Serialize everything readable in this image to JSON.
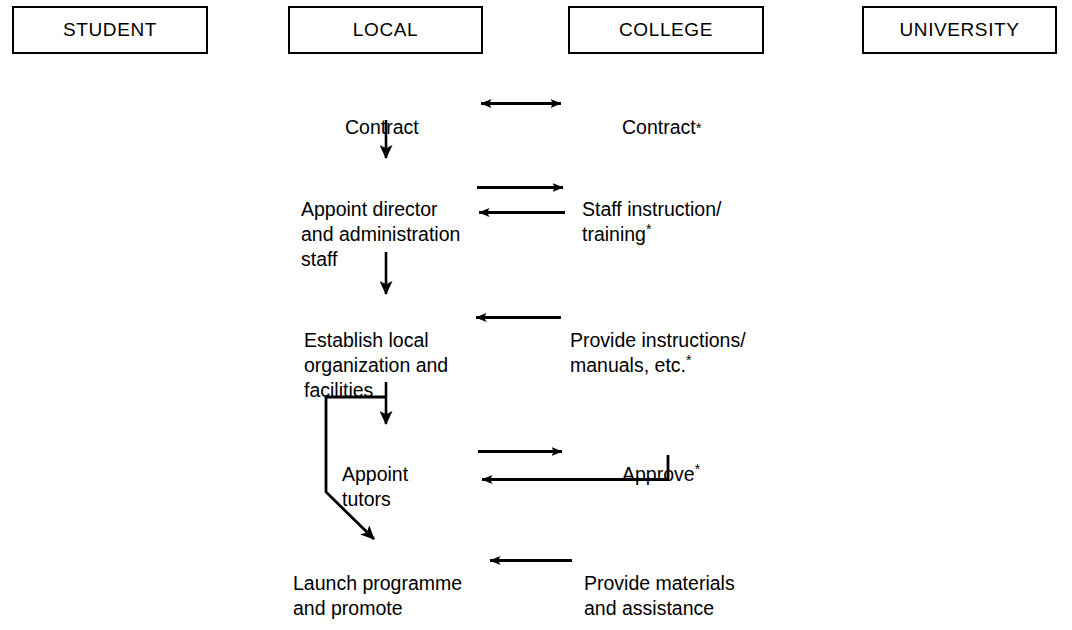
{
  "diagram": {
    "columns": [
      {
        "id": "student",
        "label": "STUDENT"
      },
      {
        "id": "local",
        "label": "LOCAL"
      },
      {
        "id": "college",
        "label": "COLLEGE"
      },
      {
        "id": "university",
        "label": "UNIVERSITY"
      }
    ],
    "nodes": {
      "local_contract": {
        "text": "Contract"
      },
      "college_contract": {
        "text": "Contract",
        "footnote": "*"
      },
      "local_appoint": {
        "text": "Appoint director\nand administration\nstaff"
      },
      "college_staff": {
        "text": "Staff instruction/\ntraining",
        "footnote": "*"
      },
      "local_establish": {
        "text": "Establish local\norganization and\nfacilities"
      },
      "college_provide": {
        "text": "Provide instructions/\nmanuals, etc.",
        "footnote": "*"
      },
      "local_tutors": {
        "text": "Appoint\ntutors"
      },
      "college_approve": {
        "text": "Approve",
        "footnote": "*"
      },
      "local_launch": {
        "text": "Launch programme\nand promote"
      },
      "college_materials": {
        "text": "Provide materials\nand assistance"
      }
    },
    "connectors": [
      {
        "id": "contract-bidirectional",
        "kind": "double-arrow-horizontal",
        "from": "local_contract",
        "to": "college_contract"
      },
      {
        "id": "contract-to-appoint",
        "kind": "arrow-down",
        "from": "local_contract",
        "to": "local_appoint"
      },
      {
        "id": "appoint-to-staff",
        "kind": "arrow-right",
        "from": "local_appoint",
        "to": "college_staff"
      },
      {
        "id": "staff-to-appoint",
        "kind": "arrow-left",
        "from": "college_staff",
        "to": "local_appoint"
      },
      {
        "id": "appoint-to-establish",
        "kind": "arrow-down",
        "from": "local_appoint",
        "to": "local_establish"
      },
      {
        "id": "provide-to-establish",
        "kind": "arrow-left",
        "from": "college_provide",
        "to": "local_establish"
      },
      {
        "id": "establish-to-tutors",
        "kind": "arrow-down",
        "from": "local_establish",
        "to": "local_tutors"
      },
      {
        "id": "establish-to-launch",
        "kind": "elbow-diagonal-arrow",
        "from": "local_establish",
        "to": "local_launch"
      },
      {
        "id": "tutors-to-approve",
        "kind": "arrow-right",
        "from": "local_tutors",
        "to": "college_approve"
      },
      {
        "id": "approve-to-tutors",
        "kind": "elbow-arrow-left",
        "from": "college_approve",
        "to": "local_tutors"
      },
      {
        "id": "materials-to-launch",
        "kind": "arrow-left",
        "from": "college_materials",
        "to": "local_launch"
      }
    ],
    "colors": {
      "stroke": "#000000",
      "text": "#000000",
      "background": "#ffffff"
    }
  }
}
